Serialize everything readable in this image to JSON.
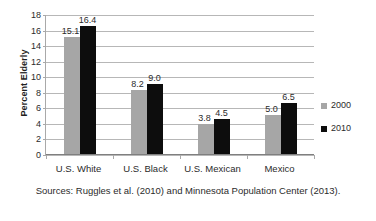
{
  "chart_data": {
    "type": "bar",
    "title": "",
    "subtitle": "",
    "xlabel": "",
    "ylabel": "Percent Elderly",
    "categories": [
      "U.S. White",
      "U.S. Black",
      "U.S. Mexican",
      "Mexico"
    ],
    "series": [
      {
        "name": "2000",
        "color": "#a6a6a6",
        "values": [
          15.1,
          8.2,
          3.8,
          5.0
        ]
      },
      {
        "name": "2010",
        "color": "#0d0d0d",
        "values": [
          16.4,
          9.0,
          4.5,
          6.5
        ]
      }
    ],
    "value_labels": [
      [
        "15.1",
        "8.2",
        "3.8",
        "5.0"
      ],
      [
        "16.4",
        "9.0",
        "4.5",
        "6.5"
      ]
    ],
    "ylim": [
      0,
      18
    ],
    "ytick_step": 2,
    "ytick_labels": [
      "18",
      "16",
      "14",
      "12",
      "10",
      "8",
      "6",
      "4",
      "2",
      "0"
    ],
    "grid": true,
    "grid_axis": "y",
    "legend_position": "right",
    "legend_entries": [
      "2000",
      "2010"
    ],
    "annotation": "Sources: Ruggles et al. (2010) and Minnesota Population Center (2013)."
  },
  "caption": {
    "text": "Sources: Ruggles et al. (2010) and Minnesota Population Center (2013)."
  }
}
